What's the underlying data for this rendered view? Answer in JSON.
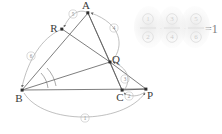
{
  "figure": {
    "type": "geometry-diagram",
    "points": [
      {
        "id": "A",
        "label": "A",
        "x": 88,
        "y": 12
      },
      {
        "id": "R",
        "label": "R",
        "x": 62,
        "y": 29
      },
      {
        "id": "Q",
        "label": "Q",
        "x": 110,
        "y": 62
      },
      {
        "id": "B",
        "label": "B",
        "x": 22,
        "y": 90
      },
      {
        "id": "C",
        "label": "C",
        "x": 122,
        "y": 90
      },
      {
        "id": "P",
        "label": "P",
        "x": 146,
        "y": 89
      }
    ],
    "segments": [
      {
        "from": "B",
        "to": "A"
      },
      {
        "from": "B",
        "to": "C"
      },
      {
        "from": "A",
        "to": "C"
      },
      {
        "from": "A",
        "to": "Q"
      },
      {
        "from": "B",
        "to": "Q"
      },
      {
        "from": "R",
        "to": "Q"
      },
      {
        "from": "C",
        "to": "P"
      },
      {
        "from": "Q",
        "to": "P"
      },
      {
        "from": "C",
        "to": "Q"
      }
    ],
    "arc_labels": [
      {
        "id": "1",
        "label": "1",
        "x": 85,
        "y": 118,
        "describes": "BP"
      },
      {
        "id": "2",
        "label": "2",
        "x": 129,
        "y": 96,
        "describes": "PC"
      },
      {
        "id": "3",
        "label": "3",
        "x": 125,
        "y": 79,
        "describes": "CQ"
      },
      {
        "id": "4",
        "label": "4",
        "x": 114,
        "y": 28,
        "describes": "QA"
      },
      {
        "id": "5",
        "label": "5",
        "x": 73,
        "y": 14,
        "describes": "AR"
      },
      {
        "id": "6",
        "label": "6",
        "x": 31,
        "y": 56,
        "describes": "RB"
      }
    ],
    "formula": {
      "numerators": [
        "1",
        "3",
        "5"
      ],
      "denominators": [
        "2",
        "4",
        "6"
      ],
      "operator": "·",
      "equals": "=1"
    }
  }
}
